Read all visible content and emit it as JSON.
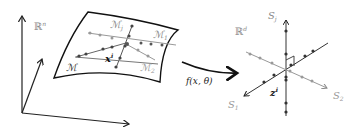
{
  "diagram": {
    "left_space": {
      "label": "ℝ",
      "label_sup": "n"
    },
    "manifolds": {
      "main": "ℳ",
      "m_j": "ℳ",
      "m_j_sub": "j",
      "m_1": "ℳ",
      "m_1_sub": "1",
      "m_2": "ℳ",
      "m_2_sub": "2",
      "point": "x",
      "point_sup": "i"
    },
    "mapping": {
      "label": "f(x, θ)"
    },
    "right_space": {
      "label": "ℝ",
      "label_sup": "d",
      "axis_j": "S",
      "axis_j_sub": "j",
      "axis_1": "S",
      "axis_1_sub": "1",
      "axis_2": "S",
      "axis_2_sub": "2",
      "point": "z",
      "point_sup": "i"
    },
    "colors": {
      "dark": "#333333",
      "gray": "#999999",
      "light_gray": "#aaaaaa"
    }
  }
}
